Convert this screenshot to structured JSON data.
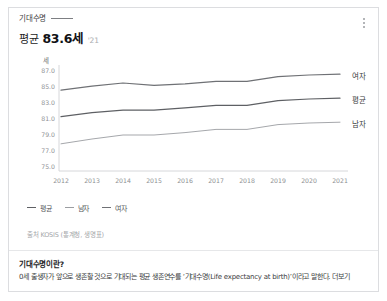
{
  "card": {
    "title": "기대수명",
    "menu_icon": "kebab-menu-icon",
    "summary": {
      "prefix": "평균",
      "value": "83.6세",
      "year": "'21"
    }
  },
  "chart_data": {
    "type": "line",
    "title": "기대수명",
    "unit_label": "세",
    "xlabel": "",
    "ylabel": "세",
    "grid": false,
    "legend_position": "bottom-left",
    "categories": [
      "2012",
      "2013",
      "2014",
      "2015",
      "2016",
      "2017",
      "2018",
      "2019",
      "2020",
      "2021"
    ],
    "yticks": [
      "87.0",
      "85.0",
      "83.0",
      "81.0",
      "79.0",
      "77.0",
      "75.0"
    ],
    "ylim": [
      75.0,
      87.0
    ],
    "series": [
      {
        "name": "여자",
        "color": "#6f7175",
        "values": [
          84.6,
          85.1,
          85.5,
          85.2,
          85.4,
          85.7,
          85.7,
          86.3,
          86.5,
          86.6
        ]
      },
      {
        "name": "평균",
        "color": "#5e6064",
        "values": [
          81.3,
          81.8,
          82.1,
          82.1,
          82.4,
          82.7,
          82.7,
          83.3,
          83.5,
          83.6
        ]
      },
      {
        "name": "남자",
        "color": "#9b9da1",
        "values": [
          77.9,
          78.5,
          79.0,
          79.0,
          79.3,
          79.7,
          79.7,
          80.3,
          80.5,
          80.6
        ]
      }
    ],
    "legend": [
      "평균",
      "남자",
      "여자"
    ],
    "end_labels": [
      "여자",
      "평균",
      "남자"
    ]
  },
  "source": "출처 KOSIS (통계청, 생명표)",
  "note": {
    "heading": "기대수명이란?",
    "body": "0세 출생자가 앞으로 생존할 것으로 기대되는 평균 생존연수를 ‘기대수명(Life expectancy at birth)’이라고 말한다.",
    "more_label": "더보기"
  }
}
